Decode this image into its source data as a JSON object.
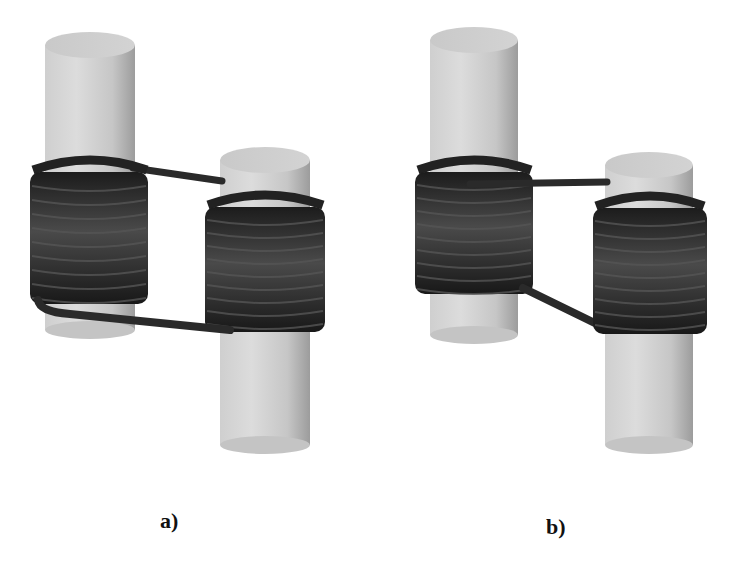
{
  "figure": {
    "panels": [
      {
        "id": "a",
        "label": "a)",
        "turns_left_coil": 9,
        "turns_right_coil": 9,
        "wiring": "upper wire from top of left coil to top of right core; lower wire from bottom of left coil to bottom of right coil"
      },
      {
        "id": "b",
        "label": "b)",
        "turns_left_coil": 9,
        "turns_right_coil": 9,
        "wiring": "upper wire from top of left coil to top of right core; lower wire from bottom of left coil diagonally to bottom of right coil"
      }
    ]
  },
  "colors": {
    "background": "#ffffff",
    "core_light": "#d9d9d9",
    "core_mid": "#c4c4c4",
    "core_dark": "#9a9a9a",
    "coil": "#262626",
    "coil_highlight": "#4a4a4a",
    "label": "#111111"
  }
}
